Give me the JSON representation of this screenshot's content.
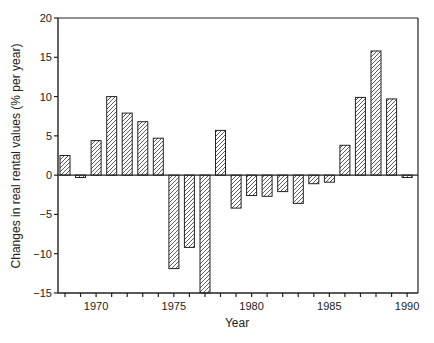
{
  "chart_data": {
    "type": "bar",
    "title": "",
    "xlabel": "Year",
    "ylabel": "Changes in real rental values (% per year)",
    "ylim": [
      -15,
      20
    ],
    "yticks": [
      -15,
      -10,
      -5,
      0,
      5,
      10,
      15,
      20
    ],
    "ytick_labels": [
      "−15",
      "−10",
      "−5",
      "0",
      "5",
      "10",
      "15",
      "20"
    ],
    "xticks_labeled": [
      1970,
      1975,
      1980,
      1985,
      1990
    ],
    "xtick_labels": [
      "1970",
      "1975",
      "1980",
      "1985",
      "1990"
    ],
    "grid": false,
    "legend": null,
    "bar_style": "diagonal-hatch",
    "categories": [
      1968,
      1969,
      1970,
      1971,
      1972,
      1973,
      1974,
      1975,
      1976,
      1977,
      1978,
      1979,
      1980,
      1981,
      1982,
      1983,
      1984,
      1985,
      1986,
      1987,
      1988,
      1989,
      1990
    ],
    "values": [
      2.5,
      -0.3,
      4.4,
      10.0,
      7.9,
      6.8,
      4.7,
      -11.9,
      -9.2,
      -15.0,
      5.7,
      -4.2,
      -2.6,
      -2.7,
      -2.1,
      -3.6,
      -1.1,
      -0.9,
      3.8,
      9.9,
      15.8,
      9.7,
      -0.3
    ]
  },
  "axes": {
    "x_title": "Year",
    "y_title": "Changes in real rental values (% per year)"
  }
}
